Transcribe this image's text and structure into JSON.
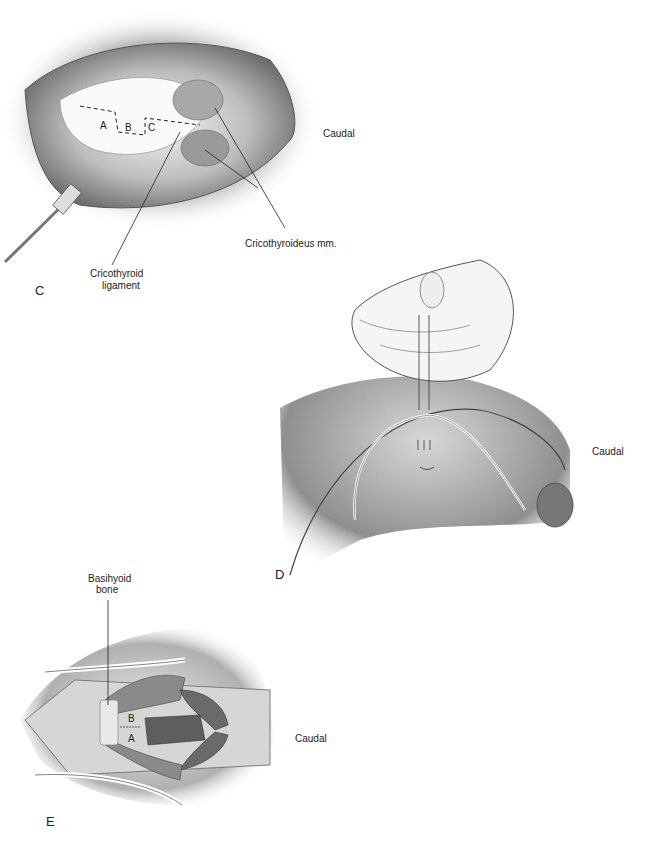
{
  "figure": {
    "panels": [
      {
        "id": "C",
        "letter": "C",
        "labels": {
          "orientation": "Caudal",
          "muscle": "Cricothyroideus mm.",
          "ligament_line1": "Cricothyroid",
          "ligament_line2": "ligament",
          "incision_a": "A",
          "incision_b": "B",
          "incision_c": "C"
        }
      },
      {
        "id": "D",
        "letter": "D",
        "labels": {
          "orientation": "Caudal"
        }
      },
      {
        "id": "E",
        "letter": "E",
        "labels": {
          "orientation": "Caudal",
          "bone_line1": "Basihyoid",
          "bone_line2": "bone",
          "suture_b": "B",
          "suture_a": "A"
        }
      }
    ]
  }
}
